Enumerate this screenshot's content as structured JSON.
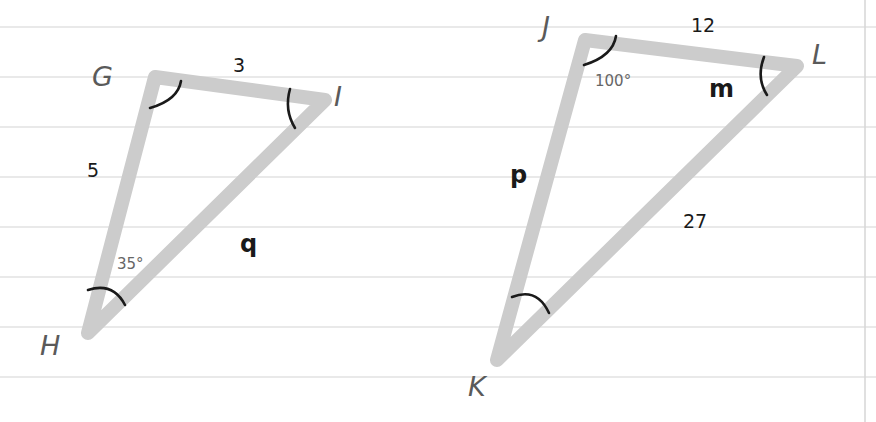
{
  "diagram": {
    "type": "similar-triangles",
    "background": {
      "style": "ruled-notebook-paper",
      "rule_color": "#e2e2e2",
      "rule_y": [
        27,
        77,
        127,
        177,
        227,
        277,
        327,
        377
      ],
      "margin_x": 865
    },
    "triangle_color": "#cccccc",
    "triangles": [
      {
        "name": "GHI",
        "vertices": {
          "G": {
            "label": "G",
            "x": 155,
            "y": 77
          },
          "I": {
            "label": "I",
            "x": 325,
            "y": 100
          },
          "H": {
            "label": "H",
            "x": 88,
            "y": 333
          }
        },
        "sides": {
          "GI": "3",
          "GH": "5",
          "HI": "q"
        },
        "angles": {
          "H": "35°"
        }
      },
      {
        "name": "JKL",
        "vertices": {
          "J": {
            "label": "J",
            "x": 585,
            "y": 40
          },
          "L": {
            "label": "L",
            "x": 797,
            "y": 66
          },
          "K": {
            "label": "K",
            "x": 497,
            "y": 360
          }
        },
        "sides": {
          "JL": "12",
          "JK": "p",
          "KL": "27"
        },
        "angles": {
          "J": "100°",
          "L": "m"
        }
      }
    ]
  }
}
